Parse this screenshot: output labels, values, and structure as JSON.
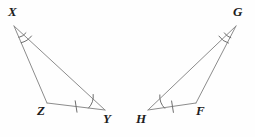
{
  "figure": {
    "kind": "geometry-diagram",
    "background_color": "#fefefe",
    "stroke_color": "#8c8c8c",
    "mark_color": "#6e6e6e",
    "label_color": "#1c1c1c",
    "stroke_width": 1
  },
  "triangles": [
    {
      "name": "triangle-xzy",
      "vertices": [
        {
          "label": "X",
          "x": 14,
          "y": 26,
          "label_x": 8,
          "label_y": 5
        },
        {
          "label": "Z",
          "x": 47,
          "y": 103,
          "label_x": 37,
          "label_y": 104
        },
        {
          "label": "Y",
          "x": 105,
          "y": 110,
          "label_x": 103,
          "label_y": 112
        }
      ],
      "angle_marks": [
        {
          "at": "X",
          "arcs": 2
        },
        {
          "at": "Y",
          "arcs": 1
        }
      ],
      "side_marks": [
        {
          "between": "ZY",
          "ticks": 1
        }
      ]
    },
    {
      "name": "triangle-ghf",
      "vertices": [
        {
          "label": "G",
          "x": 236,
          "y": 26,
          "label_x": 233,
          "label_y": 5
        },
        {
          "label": "F",
          "x": 196,
          "y": 103,
          "label_x": 196,
          "label_y": 104
        },
        {
          "label": "H",
          "x": 148,
          "y": 110,
          "label_x": 136,
          "label_y": 112
        }
      ],
      "angle_marks": [
        {
          "at": "G",
          "arcs": 2
        },
        {
          "at": "H",
          "arcs": 1
        }
      ],
      "side_marks": [
        {
          "between": "HF",
          "ticks": 1
        }
      ]
    }
  ]
}
